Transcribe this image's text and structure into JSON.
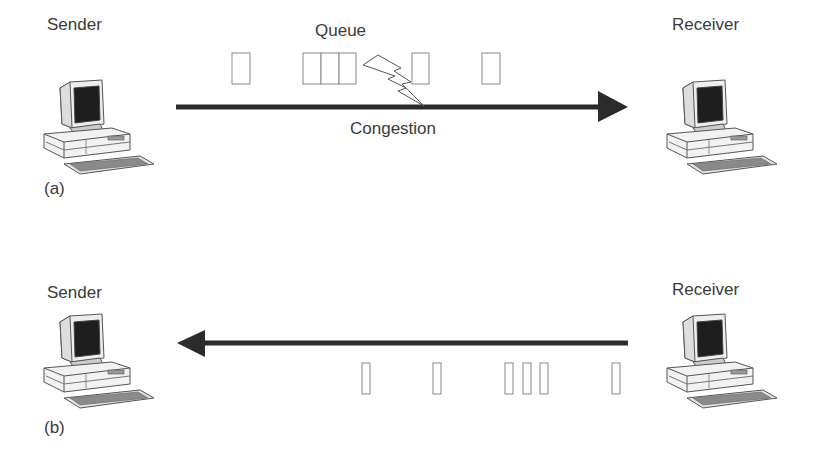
{
  "panels": [
    {
      "id": "a",
      "panel_label": "(a)",
      "sender_label": "Sender",
      "receiver_label": "Receiver",
      "queue_label": "Queue",
      "congestion_label": "Congestion",
      "arrow_direction": "sender-to-receiver",
      "packets": [
        {
          "x": 232,
          "w": 18
        },
        {
          "x": 303,
          "w": 18
        },
        {
          "x": 321,
          "w": 18
        },
        {
          "x": 339,
          "w": 17
        },
        {
          "x": 412,
          "w": 17
        },
        {
          "x": 482,
          "w": 18
        }
      ]
    },
    {
      "id": "b",
      "panel_label": "(b)",
      "sender_label": "Sender",
      "receiver_label": "Receiver",
      "arrow_direction": "receiver-to-sender",
      "packets": [
        {
          "x": 362,
          "w": 8
        },
        {
          "x": 433,
          "w": 8
        },
        {
          "x": 505,
          "w": 8
        },
        {
          "x": 523,
          "w": 8
        },
        {
          "x": 540,
          "w": 8
        },
        {
          "x": 612,
          "w": 8
        }
      ]
    }
  ],
  "colors": {
    "arrow": "#2b2b2b",
    "packet_stroke": "#888888",
    "text": "#3a3a3a",
    "screen": "#1e1e1e"
  },
  "icons": {
    "computer": "desktop-computer-icon",
    "congestion": "lightning-bolt-icon"
  }
}
